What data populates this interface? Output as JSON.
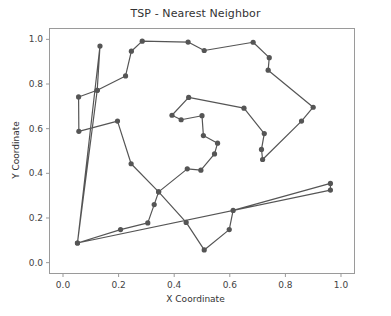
{
  "chart_data": {
    "type": "scatter",
    "title": "TSP - Nearest Neighbor",
    "xlabel": "X Coordinate",
    "ylabel": "Y Coordinate",
    "xlim": [
      -0.0486,
      1.0486
    ],
    "ylim": [
      -0.0486,
      1.0486
    ],
    "xticks": [
      0.0,
      0.2,
      0.4,
      0.6,
      0.8,
      1.0
    ],
    "xtick_labels": [
      "0.0",
      "0.2",
      "0.4",
      "0.6",
      "0.8",
      "1.0"
    ],
    "yticks": [
      0.0,
      0.2,
      0.4,
      0.6,
      0.8,
      1.0
    ],
    "ytick_labels": [
      "0.0",
      "0.2",
      "0.4",
      "0.6",
      "0.8",
      "1.0"
    ],
    "grid": false,
    "legend": null,
    "line_color": "#555555",
    "marker_color": "#555555",
    "marker": "o",
    "marker_size": 4,
    "line_width": 1.2,
    "closed_tour": true,
    "point_count": 42,
    "tour_label": "nearest-neighbor-route",
    "tour": [
      {
        "x": 0.052,
        "y": 0.088
      },
      {
        "x": 0.133,
        "y": 0.97
      },
      {
        "x": 0.123,
        "y": 0.772
      },
      {
        "x": 0.056,
        "y": 0.742
      },
      {
        "x": 0.057,
        "y": 0.588
      },
      {
        "x": 0.196,
        "y": 0.634
      },
      {
        "x": 0.245,
        "y": 0.443
      },
      {
        "x": 0.344,
        "y": 0.317
      },
      {
        "x": 0.328,
        "y": 0.26
      },
      {
        "x": 0.305,
        "y": 0.178
      },
      {
        "x": 0.207,
        "y": 0.148
      },
      {
        "x": 0.052,
        "y": 0.088
      },
      {
        "x": 0.962,
        "y": 0.325
      },
      {
        "x": 0.962,
        "y": 0.355
      },
      {
        "x": 0.612,
        "y": 0.234
      },
      {
        "x": 0.598,
        "y": 0.148
      },
      {
        "x": 0.508,
        "y": 0.057
      },
      {
        "x": 0.443,
        "y": 0.18
      },
      {
        "x": 0.344,
        "y": 0.317
      },
      {
        "x": 0.447,
        "y": 0.42
      },
      {
        "x": 0.496,
        "y": 0.414
      },
      {
        "x": 0.545,
        "y": 0.487
      },
      {
        "x": 0.556,
        "y": 0.535
      },
      {
        "x": 0.505,
        "y": 0.569
      },
      {
        "x": 0.5,
        "y": 0.658
      },
      {
        "x": 0.425,
        "y": 0.64
      },
      {
        "x": 0.392,
        "y": 0.66
      },
      {
        "x": 0.452,
        "y": 0.74
      },
      {
        "x": 0.651,
        "y": 0.692
      },
      {
        "x": 0.724,
        "y": 0.578
      },
      {
        "x": 0.714,
        "y": 0.507
      },
      {
        "x": 0.718,
        "y": 0.462
      },
      {
        "x": 0.858,
        "y": 0.634
      },
      {
        "x": 0.9,
        "y": 0.696
      },
      {
        "x": 0.738,
        "y": 0.862
      },
      {
        "x": 0.742,
        "y": 0.918
      },
      {
        "x": 0.684,
        "y": 0.987
      },
      {
        "x": 0.508,
        "y": 0.95
      },
      {
        "x": 0.45,
        "y": 0.988
      },
      {
        "x": 0.285,
        "y": 0.992
      },
      {
        "x": 0.246,
        "y": 0.947
      },
      {
        "x": 0.225,
        "y": 0.836
      },
      {
        "x": 0.123,
        "y": 0.772
      }
    ]
  }
}
